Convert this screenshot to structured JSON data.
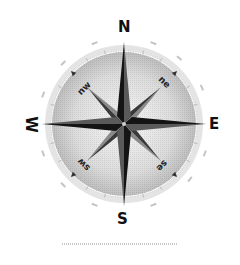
{
  "figure": {
    "type": "compass-rose",
    "cardinals": {
      "n": "N",
      "s": "S",
      "e": "E",
      "w": "W"
    },
    "intercardinals": {
      "nw": "nw",
      "ne": "ne",
      "sw": "sw",
      "se": "se"
    },
    "colors": {
      "arrow_dark": "#1a1a1a",
      "arrow_mid": "#5a5a5a",
      "arrow_light": "#8c8c8c",
      "ring": "#d9d9d9",
      "dial_center": "#f2f2f2",
      "dial_edge": "#bdbdbd",
      "label": "#111111"
    }
  }
}
